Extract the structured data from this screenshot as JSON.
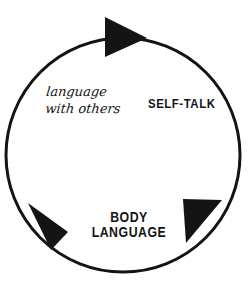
{
  "diagram": {
    "type": "cycle",
    "background_color": "#ffffff",
    "stroke_color": "#141414",
    "circle": {
      "center_x": 123,
      "center_y": 155,
      "radius": 117,
      "stroke_width": 3
    },
    "labels": [
      {
        "id": "self-talk",
        "text": "SELF-TALK",
        "style": "bold-condensed-caps"
      },
      {
        "id": "body-language",
        "line_1": "BODY",
        "line_2": "LANGUAGE",
        "style": "bold-condensed-caps"
      },
      {
        "id": "language-with-others",
        "line_1": "language",
        "line_2": "with others",
        "style": "cursive-script"
      }
    ],
    "arrows": [
      {
        "id": "arrow-top",
        "direction": "right",
        "position": "top"
      },
      {
        "id": "arrow-bottom-right",
        "direction": "down-left",
        "position": "bottom-right"
      },
      {
        "id": "arrow-bottom-left",
        "direction": "down-left",
        "position": "bottom-left"
      }
    ]
  }
}
